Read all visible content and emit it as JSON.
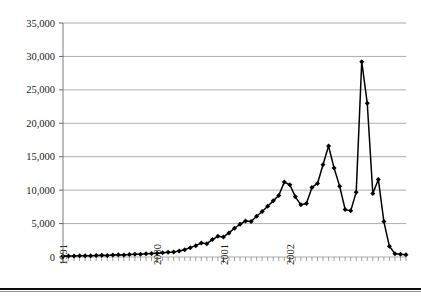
{
  "chart_data": {
    "type": "line",
    "title": "",
    "subtitle": "",
    "xlabel": "",
    "ylabel": "",
    "ylim": [
      0,
      35000
    ],
    "ytick_labels": [
      "0",
      "5,000",
      "10,000",
      "15,000",
      "20,000",
      "25,000",
      "30,000",
      "35,000"
    ],
    "ytick_values": [
      0,
      5000,
      10000,
      15000,
      20000,
      25000,
      30000,
      35000
    ],
    "xtick_labels": [
      "1991",
      "2000",
      "2001",
      "2002"
    ],
    "xtick_label_positions": [
      0,
      17,
      29,
      41
    ],
    "grid": "horizontal",
    "legend": "none",
    "marker": "diamond",
    "line_color": "#000000",
    "marker_color": "#000000",
    "grid_color": "#8a8a8a",
    "x": [
      0,
      1,
      2,
      3,
      4,
      5,
      6,
      7,
      8,
      9,
      10,
      11,
      12,
      13,
      14,
      15,
      16,
      17,
      18,
      19,
      20,
      21,
      22,
      23,
      24,
      25,
      26,
      27,
      28,
      29,
      30,
      31,
      32,
      33,
      34,
      35,
      36,
      37,
      38,
      39,
      40,
      41,
      42,
      43,
      44,
      45,
      46,
      47,
      48,
      49,
      50,
      51,
      52,
      53,
      54,
      55,
      56,
      57,
      58,
      59,
      60,
      61,
      62
    ],
    "values": [
      120,
      150,
      140,
      180,
      200,
      190,
      230,
      260,
      240,
      300,
      330,
      310,
      380,
      420,
      400,
      470,
      520,
      560,
      620,
      700,
      760,
      900,
      1100,
      1400,
      1700,
      2100,
      2000,
      2600,
      3100,
      3000,
      3600,
      4300,
      4900,
      5400,
      5300,
      6100,
      6800,
      7600,
      8400,
      9200,
      11200,
      10800,
      9000,
      7800,
      8000,
      10400,
      11000,
      13800,
      16600,
      13300,
      10600,
      7100,
      6900,
      9700,
      29200,
      23000,
      9500,
      11600,
      5300,
      1600,
      500,
      400,
      350
    ],
    "peak_primary": 29200,
    "peak_secondary": 23000,
    "peak_third": 16600,
    "series_name": ""
  },
  "axes": {
    "y_axis_name": "value-axis",
    "x_axis_name": "time-axis"
  }
}
